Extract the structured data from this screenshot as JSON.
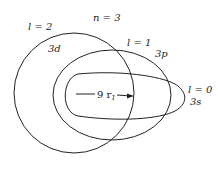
{
  "figure": {
    "stroke_color": "#222222",
    "background": "#ffffff",
    "principal_quantum_number": "n = 3",
    "orbits": [
      {
        "name": "3d",
        "l_label": "l = 2",
        "sub_label": "3d",
        "shape": "circle"
      },
      {
        "name": "3p",
        "l_label": "l = 1",
        "sub_label": "3p",
        "shape": "ellipse"
      },
      {
        "name": "3s",
        "l_label": "l = 0",
        "sub_label": "3s",
        "shape": "elongated-ellipse"
      }
    ],
    "arrow_label": "9 r",
    "arrow_subscript": "1"
  }
}
